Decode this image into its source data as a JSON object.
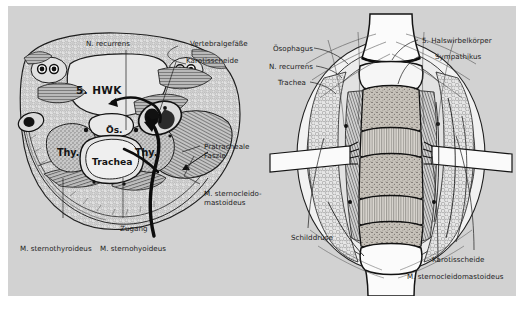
{
  "figure": {
    "background_color": "#d2d2d2",
    "page_color": "#ffffff",
    "text_color": "#1c1c1c"
  },
  "left_panel": {
    "name": "axial-cross-section-C5",
    "inline_labels": [
      {
        "key": "vertebra",
        "text": "5. HWK"
      },
      {
        "key": "esophagus",
        "text": "Ös."
      },
      {
        "key": "thyroid_left",
        "text": "Thy."
      },
      {
        "key": "thyroid_right",
        "text": "Thy."
      },
      {
        "key": "trachea",
        "text": "Trachea"
      }
    ],
    "callouts": [
      {
        "key": "n-recurrens",
        "text": "N. recurrens"
      },
      {
        "key": "vertebralgefaesse",
        "text": "Vertebralgefäße"
      },
      {
        "key": "karotisscheide",
        "text": "Karotisscheide"
      },
      {
        "key": "praetracheale-faszie",
        "text": "Prätracheale\nFaszie"
      },
      {
        "key": "m-sternocleidomastoideus",
        "text": "M. sternocleido-\nmastoideus"
      },
      {
        "key": "zugang",
        "text": "Zugang"
      },
      {
        "key": "m-sternothyroideus",
        "text": "M. sternothyroideus"
      },
      {
        "key": "m-sternohyoideus",
        "text": "M. sternohyoideus"
      }
    ]
  },
  "right_panel": {
    "name": "operative-exposure-anterior-cervical",
    "callouts": [
      {
        "key": "oesophagus",
        "text": "Ösophagus"
      },
      {
        "key": "n-recurrens",
        "text": "N. recurrens"
      },
      {
        "key": "trachea",
        "text": "Trachea"
      },
      {
        "key": "halswirbelkoerper",
        "text": "5. Halswirbelkörper"
      },
      {
        "key": "sympathikus",
        "text": "Sympathikus"
      },
      {
        "key": "schilddruese",
        "text": "Schilddrüse"
      },
      {
        "key": "karotisscheide",
        "text": "Karotisscheide"
      },
      {
        "key": "m-sternocleidomastoideus",
        "text": "M. sternocleidomastoideus"
      }
    ]
  }
}
